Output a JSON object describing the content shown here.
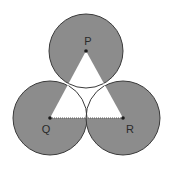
{
  "diagram": {
    "colors": {
      "shade": "#8c8c8c",
      "outline": "#3a3a3a",
      "triangle_fill": "#ffffff",
      "background": "#ffffff"
    },
    "circles": [
      {
        "center_label": "P",
        "cx": 86,
        "cy": 51,
        "r": 37
      },
      {
        "center_label": "Q",
        "cx": 50,
        "cy": 118,
        "r": 37
      },
      {
        "center_label": "R",
        "cx": 123,
        "cy": 118,
        "r": 37
      }
    ],
    "labels": {
      "p": "P",
      "q": "Q",
      "r": "R"
    }
  }
}
